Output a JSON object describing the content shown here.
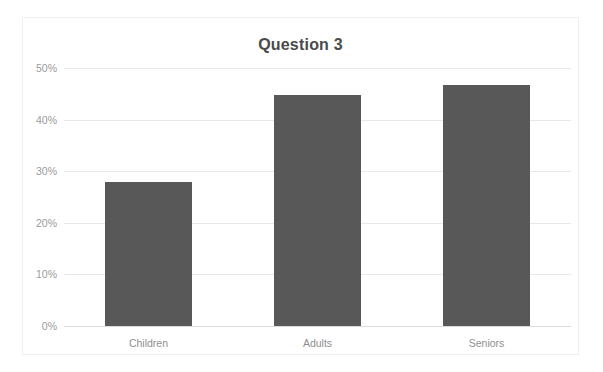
{
  "chart_data": {
    "type": "bar",
    "title": "Question 3",
    "xlabel": "",
    "ylabel": "",
    "categories": [
      "Children",
      "Adults",
      "Seniors"
    ],
    "values": [
      28,
      44.7,
      46.8
    ],
    "value_unit": "%",
    "ylim": [
      0,
      50
    ],
    "y_ticks": [
      0,
      10,
      20,
      30,
      40,
      50
    ],
    "y_tick_labels": [
      "0%",
      "10%",
      "20%",
      "30%",
      "40%",
      "50%"
    ],
    "grid": true,
    "legend": false,
    "legend_position": "none",
    "series": [
      {
        "name": "Question 3",
        "values": [
          28,
          44.7,
          46.8
        ],
        "color": "#585858"
      }
    ]
  },
  "style": {
    "bar_color": "#585858",
    "title_color": "#4a4a4a",
    "tick_color": "#9a9a9a",
    "gridline_color": "#e8e8e8",
    "card_border_color": "#f0f0f0",
    "background": "#ffffff"
  }
}
